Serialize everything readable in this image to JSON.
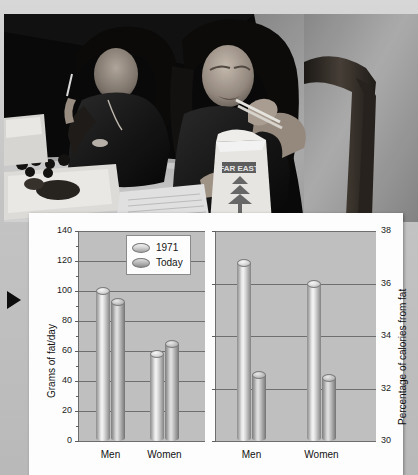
{
  "photo": {
    "alt_name": "two-women-eating-takeout-photo",
    "description": "Black and white photograph of two women eating takeout food with chopsticks at a table",
    "carton_text": "FAR EAST"
  },
  "marker": {
    "name": "figure-pointer-triangle"
  },
  "legend": {
    "position": "top-center-left-panel",
    "entries": [
      {
        "label": "1971",
        "key": "1971"
      },
      {
        "label": "Today",
        "key": "today"
      }
    ]
  },
  "chart_data": [
    {
      "type": "bar",
      "id": "grams-of-fat-per-day",
      "title": "",
      "xlabel": "",
      "ylabel": "Grams of fat/day",
      "ylim": [
        0,
        140
      ],
      "yticks": [
        0,
        20,
        40,
        60,
        80,
        100,
        120,
        140
      ],
      "ytick_labels": [
        "0",
        "20",
        "40",
        "60",
        "80",
        "100",
        "120",
        "140"
      ],
      "axis_side": "left",
      "grid": true,
      "categories": [
        "Men",
        "Women"
      ],
      "series": [
        {
          "name": "1971",
          "values": [
            100,
            58
          ]
        },
        {
          "name": "Today",
          "values": [
            93,
            65
          ]
        }
      ]
    },
    {
      "type": "bar",
      "id": "percentage-of-calories-from-fat",
      "title": "",
      "xlabel": "",
      "ylabel": "Percentage of calories from fat",
      "ylim": [
        30,
        38
      ],
      "yticks": [
        30,
        32,
        34,
        36,
        38
      ],
      "ytick_labels": [
        "30",
        "32",
        "34",
        "36",
        "38"
      ],
      "axis_side": "right",
      "grid": true,
      "categories": [
        "Men",
        "Women"
      ],
      "series": [
        {
          "name": "1971",
          "values": [
            36.8,
            36.0
          ]
        },
        {
          "name": "Today",
          "values": [
            32.5,
            32.4
          ]
        }
      ]
    }
  ],
  "colors": {
    "plot_background": "#bfbfbf",
    "panel_background": "#fdfdfd",
    "gridline": "#6f6f6f",
    "text": "#111111",
    "page_background": "#c9c9c9"
  }
}
